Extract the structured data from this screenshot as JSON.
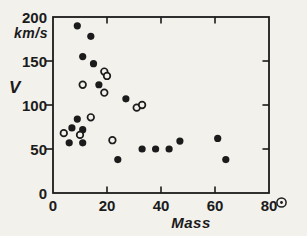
{
  "page": {
    "background": "#f2f1ec",
    "ink": "#1b1b1b"
  },
  "chart_data": {
    "type": "scatter",
    "title": "",
    "xlabel": "Mass",
    "xlabel_unit_icon": "sun-symbol",
    "ylabel": "V",
    "y_axis_unit": "km/s",
    "xlim": [
      0,
      80
    ],
    "ylim": [
      0,
      200
    ],
    "x_ticks": [
      0,
      20,
      40,
      60,
      80
    ],
    "y_ticks": [
      0,
      50,
      100,
      150,
      200
    ],
    "grid": false,
    "legend": "none",
    "series": [
      {
        "name": "filled-circles",
        "marker": "filled-circle",
        "points": [
          [
            9,
            190
          ],
          [
            14,
            178
          ],
          [
            11,
            155
          ],
          [
            15,
            147
          ],
          [
            17,
            123
          ],
          [
            27,
            107
          ],
          [
            9,
            84
          ],
          [
            7,
            74
          ],
          [
            11,
            72
          ],
          [
            6,
            57
          ],
          [
            11,
            57
          ],
          [
            24,
            38
          ],
          [
            33,
            50
          ],
          [
            38,
            50
          ],
          [
            43,
            50
          ],
          [
            47,
            59
          ],
          [
            61,
            62
          ],
          [
            64,
            38
          ]
        ]
      },
      {
        "name": "open-circles",
        "marker": "open-circle",
        "points": [
          [
            4,
            68
          ],
          [
            10,
            66
          ],
          [
            11,
            123
          ],
          [
            14,
            86
          ],
          [
            19,
            138
          ],
          [
            20,
            133
          ],
          [
            19,
            114
          ],
          [
            22,
            60
          ],
          [
            31,
            97
          ],
          [
            33,
            100
          ]
        ]
      }
    ]
  }
}
